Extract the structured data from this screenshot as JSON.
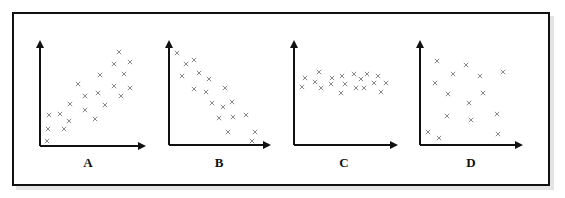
{
  "figure": {
    "axis_color": "#111111",
    "marker_color": "#888888",
    "marker": "x"
  },
  "chart_data": [
    {
      "type": "scatter",
      "label": "A",
      "trend": "positive correlation",
      "axis": {
        "x0": 40,
        "y0": 146,
        "xTop": 40,
        "yTop": 40,
        "xEnd": 146
      },
      "points": [
        [
          47,
          141
        ],
        [
          48,
          129
        ],
        [
          64,
          129
        ],
        [
          49,
          115
        ],
        [
          60,
          114
        ],
        [
          69,
          121
        ],
        [
          70,
          104
        ],
        [
          78,
          84
        ],
        [
          85,
          96
        ],
        [
          85,
          110
        ],
        [
          95,
          119
        ],
        [
          98,
          93
        ],
        [
          105,
          105
        ],
        [
          100,
          75
        ],
        [
          114,
          86
        ],
        [
          121,
          96
        ],
        [
          114,
          64
        ],
        [
          119,
          52
        ],
        [
          124,
          74
        ],
        [
          130,
          62
        ],
        [
          130,
          88
        ]
      ]
    },
    {
      "type": "scatter",
      "label": "B",
      "trend": "negative correlation",
      "axis": {
        "x0": 169,
        "y0": 145,
        "xTop": 169,
        "yTop": 40,
        "xEnd": 271
      },
      "points": [
        [
          177,
          53
        ],
        [
          186,
          64
        ],
        [
          194,
          60
        ],
        [
          182,
          76
        ],
        [
          199,
          73
        ],
        [
          209,
          79
        ],
        [
          194,
          89
        ],
        [
          206,
          92
        ],
        [
          225,
          88
        ],
        [
          212,
          103
        ],
        [
          223,
          107
        ],
        [
          232,
          102
        ],
        [
          219,
          118
        ],
        [
          233,
          117
        ],
        [
          246,
          115
        ],
        [
          228,
          132
        ],
        [
          255,
          132
        ],
        [
          252,
          141
        ]
      ]
    },
    {
      "type": "scatter",
      "label": "C",
      "trend": "no correlation (flat)",
      "axis": {
        "x0": 294,
        "y0": 145,
        "xTop": 294,
        "yTop": 40,
        "xEnd": 398
      },
      "points": [
        [
          305,
          78
        ],
        [
          302,
          87
        ],
        [
          319,
          72
        ],
        [
          315,
          82
        ],
        [
          321,
          88
        ],
        [
          332,
          78
        ],
        [
          331,
          84
        ],
        [
          342,
          76
        ],
        [
          345,
          84
        ],
        [
          341,
          93
        ],
        [
          354,
          74
        ],
        [
          361,
          79
        ],
        [
          367,
          74
        ],
        [
          356,
          88
        ],
        [
          364,
          88
        ],
        [
          378,
          76
        ],
        [
          374,
          83
        ],
        [
          386,
          83
        ],
        [
          381,
          92
        ]
      ]
    },
    {
      "type": "scatter",
      "label": "D",
      "trend": "no correlation (random)",
      "axis": {
        "x0": 420,
        "y0": 145,
        "xTop": 420,
        "yTop": 40,
        "xEnd": 523
      },
      "points": [
        [
          437,
          61
        ],
        [
          466,
          65
        ],
        [
          453,
          74
        ],
        [
          480,
          76
        ],
        [
          503,
          72
        ],
        [
          435,
          83
        ],
        [
          448,
          94
        ],
        [
          483,
          93
        ],
        [
          469,
          103
        ],
        [
          447,
          116
        ],
        [
          471,
          120
        ],
        [
          497,
          114
        ],
        [
          428,
          132
        ],
        [
          439,
          138
        ],
        [
          498,
          134
        ]
      ]
    }
  ],
  "labels": {
    "a": "A",
    "b": "B",
    "c": "C",
    "d": "D"
  }
}
